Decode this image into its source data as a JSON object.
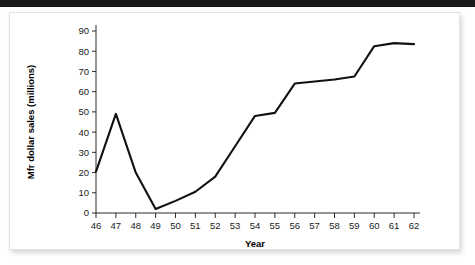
{
  "figure": {
    "background_color": "#ffffff",
    "card_border_color": "#e3e3e3",
    "top_bar_color": "#1a1a1a"
  },
  "chart_data": {
    "type": "line",
    "title": "",
    "xlabel": "Year",
    "ylabel": "Mfr dollar sales (millions)",
    "xlim": [
      46,
      62
    ],
    "ylim": [
      0,
      90
    ],
    "grid": false,
    "legend": false,
    "line_color": "#111111",
    "x": [
      46,
      47,
      48,
      49,
      50,
      51,
      52,
      53,
      54,
      55,
      56,
      57,
      58,
      59,
      60,
      61,
      62
    ],
    "xticklabels": [
      "46",
      "47",
      "48",
      "49",
      "50",
      "51",
      "52",
      "53",
      "54",
      "55",
      "56",
      "57",
      "58",
      "59",
      "60",
      "61",
      "62"
    ],
    "yticks": [
      0,
      10,
      20,
      30,
      40,
      50,
      60,
      70,
      80,
      90
    ],
    "yticklabels": [
      "0",
      "10",
      "20",
      "30",
      "40",
      "50",
      "60",
      "70",
      "80",
      "90"
    ],
    "values": [
      20.5,
      49,
      20,
      2,
      6,
      10.5,
      18,
      33,
      48,
      49.5,
      64,
      65,
      66,
      67.5,
      82.5,
      84,
      83.5
    ]
  }
}
